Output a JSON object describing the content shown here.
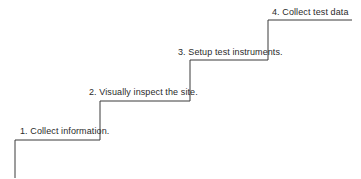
{
  "diagram": {
    "type": "staircase-process",
    "line_color": "#3a3a3a",
    "text_color": "#2a2a2a",
    "steps": [
      {
        "number": "1.",
        "label": "1.  Collect  information."
      },
      {
        "number": "2.",
        "label": "2.  Visually inspect the site."
      },
      {
        "number": "3.",
        "label": "3.  Setup test instruments."
      },
      {
        "number": "4.",
        "label": "4.  Collect test data"
      }
    ]
  }
}
